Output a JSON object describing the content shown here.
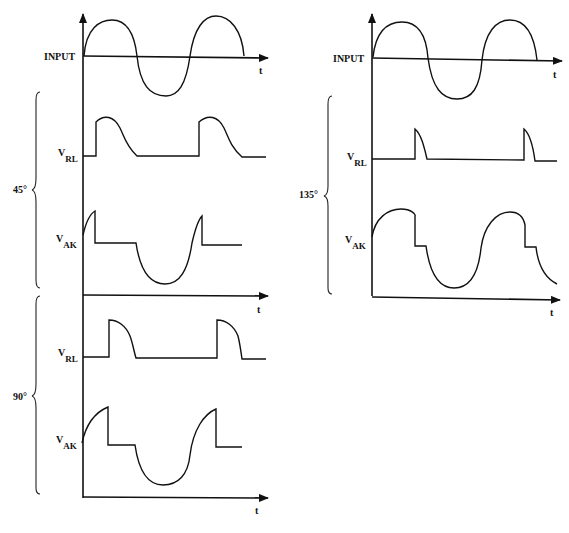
{
  "panels": [
    {
      "id": "left",
      "input_label": "INPUT",
      "time_label": "t",
      "groups": [
        {
          "angle_label": "45°",
          "vrl_label": "V",
          "vrl_sub": "RL",
          "vak_label": "V",
          "vak_sub": "AK",
          "time_label": "t"
        },
        {
          "angle_label": "90°",
          "vrl_label": "V",
          "vrl_sub": "RL",
          "vak_label": "V",
          "vak_sub": "AK",
          "time_label": "t"
        }
      ]
    },
    {
      "id": "right",
      "input_label": "INPUT",
      "time_label": "t",
      "groups": [
        {
          "angle_label": "135°",
          "vrl_label": "V",
          "vrl_sub": "RL",
          "vak_label": "V",
          "vak_sub": "AK",
          "time_label": "t"
        }
      ]
    }
  ],
  "colors": {
    "ink": "#111111",
    "background": "#ffffff"
  }
}
